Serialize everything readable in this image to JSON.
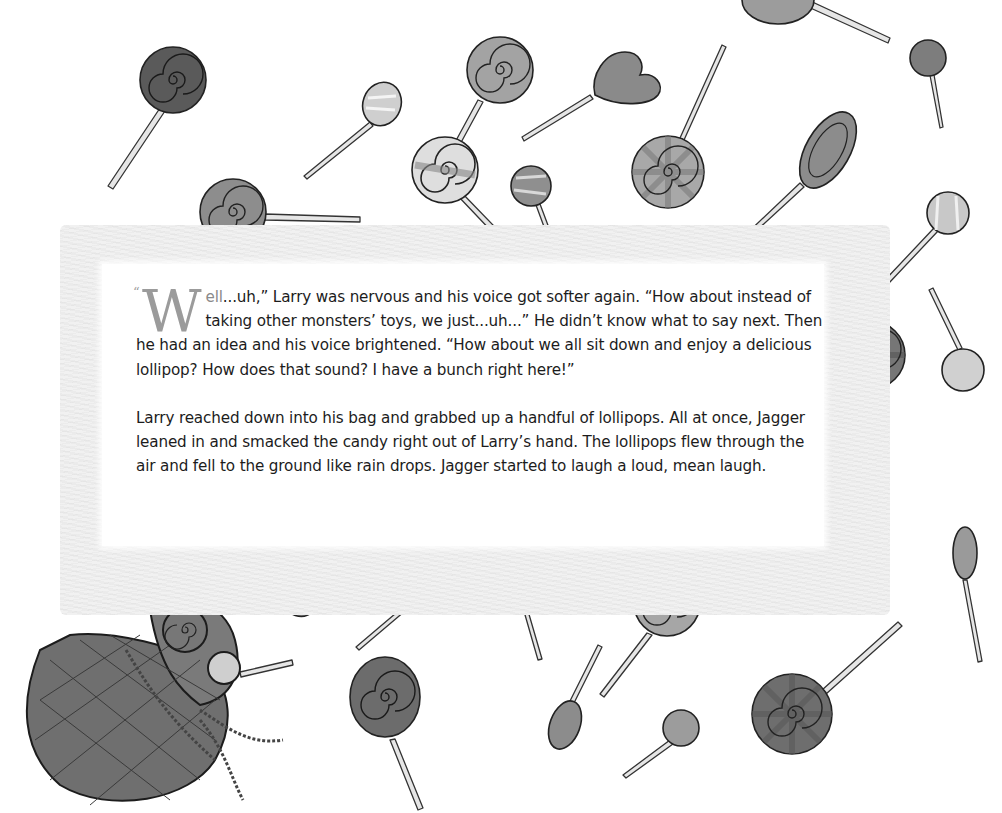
{
  "page": {
    "type": "storybook-page",
    "background_color": "#ffffff",
    "frame_color": "#f1f1f1",
    "ink_color": "#1c1c1c",
    "drop_cap_color": "#9b9b9b"
  },
  "story": {
    "open_quote": "“",
    "drop_cap": "W",
    "drop_cap_rest": "ell",
    "paragraph_1_rest": "...uh,” Larry was nervous and his voice got softer again. “How about instead of taking other monsters’ toys, we just...uh...” He didn’t know what to say next. Then he had an idea and his voice brightened. “How about we all sit down and enjoy a delicious lollipop? How does that sound? I have a bunch right here!”",
    "paragraph_2": "Larry reached down into his bag and grabbed up a handful of lollipops. All at once, Jagger leaned in and smacked the candy right out of Larry’s hand. The lollipops flew through the air and fell to the ground like rain drops. Jagger started to laugh a loud, mean laugh."
  },
  "illustration": {
    "description": "Pencil-drawn lollipops scattered around the page, with a drawstring candy bag spilling lollipops at bottom-left",
    "items": [
      {
        "kind": "swirl-lollipop",
        "shade": "dark"
      },
      {
        "kind": "striped-lollipop",
        "shade": "light"
      },
      {
        "kind": "swirl-lollipop",
        "shade": "medium"
      },
      {
        "kind": "heart-lollipop",
        "shade": "medium"
      },
      {
        "kind": "ball-lollipop",
        "shade": "medium"
      },
      {
        "kind": "pinwheel-lollipop",
        "shade": "medium"
      },
      {
        "kind": "oval-lollipop",
        "shade": "medium"
      },
      {
        "kind": "candy-bag",
        "shade": "dark"
      }
    ]
  }
}
